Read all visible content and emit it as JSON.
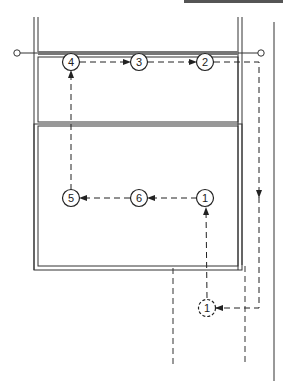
{
  "diagram": {
    "type": "sequence-path-diagram",
    "stroke_color": "#333333",
    "nodes": [
      {
        "id": "1",
        "label": "1",
        "x": 205,
        "y": 198,
        "style": "solid"
      },
      {
        "id": "6",
        "label": "6",
        "x": 139,
        "y": 198,
        "style": "solid"
      },
      {
        "id": "5",
        "label": "5",
        "x": 71,
        "y": 198,
        "style": "solid"
      },
      {
        "id": "4",
        "label": "4",
        "x": 71,
        "y": 62,
        "style": "solid"
      },
      {
        "id": "3",
        "label": "3",
        "x": 139,
        "y": 62,
        "style": "solid"
      },
      {
        "id": "2",
        "label": "2",
        "x": 205,
        "y": 62,
        "style": "solid"
      },
      {
        "id": "1-start",
        "label": "1",
        "x": 207,
        "y": 308,
        "style": "dashed"
      }
    ],
    "edges": [
      {
        "from": "1-start",
        "to": "1",
        "style": "dashed"
      },
      {
        "from": "1",
        "to": "6",
        "style": "dashed"
      },
      {
        "from": "6",
        "to": "5",
        "style": "dashed"
      },
      {
        "from": "5",
        "to": "4",
        "style": "dashed"
      },
      {
        "from": "4",
        "to": "3",
        "style": "dashed"
      },
      {
        "from": "3",
        "to": "2",
        "style": "dashed"
      },
      {
        "from": "2",
        "to": "1-start",
        "style": "dashed",
        "via": "right-side loop"
      }
    ],
    "frame": {
      "upper_panel": "top compartment",
      "lower_panel": "bottom compartment",
      "rail": "horizontal rod with end terminals"
    }
  }
}
